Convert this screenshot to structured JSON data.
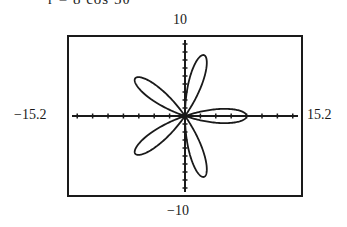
{
  "caption": "r = 8 cos 5θ",
  "chart_data": {
    "type": "line",
    "title": "",
    "curve": "polar rose r = 8 cos 5θ (5 petals)",
    "polar": {
      "amplitude": 8,
      "k": 5,
      "theta_range": [
        0,
        3.14159
      ]
    },
    "window": {
      "xmin": -15.2,
      "xmax": 15.2,
      "ymin": -10,
      "ymax": 10
    },
    "tick_labels": {
      "top": "10",
      "bottom": "-10",
      "left": "-15.2",
      "right": "15.2"
    },
    "xlabel": "",
    "ylabel": "",
    "grid": false,
    "axes_ticks": {
      "x_step": 2,
      "y_step": 1
    }
  },
  "labels": {
    "ymax": "10",
    "ymin": "−10",
    "xmin": "−15.2",
    "xmax": "15.2"
  },
  "colors": {
    "ink": "#1a1a1a",
    "background": "#ffffff"
  }
}
